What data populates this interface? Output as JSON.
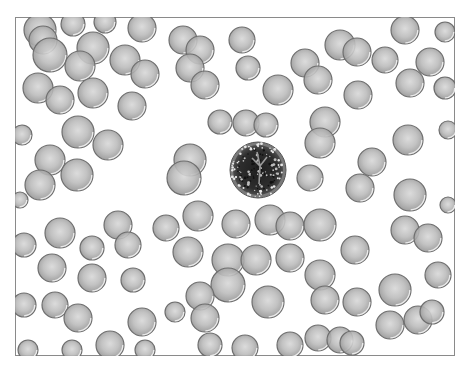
{
  "figure": {
    "width": 470,
    "height": 379,
    "frame": {
      "x": 15,
      "y": 17,
      "w": 440,
      "h": 339
    },
    "colors": {
      "background": "#ffffff",
      "frame_border": "#8a8a8a",
      "rbc_fill": "#b4b4b4",
      "rbc_center": "#d6d6d6",
      "rbc_edge": "#6e6e6e",
      "wbc_fill": "#2a2a2a",
      "wbc_edge": "#555555"
    },
    "leukocyte": {
      "cx": 258,
      "cy": 170,
      "r": 28
    },
    "cells": [
      {
        "cx": 40,
        "cy": 30,
        "r": 16
      },
      {
        "cx": 43,
        "cy": 40,
        "r": 14
      },
      {
        "cx": 50,
        "cy": 55,
        "r": 17
      },
      {
        "cx": 73,
        "cy": 24,
        "r": 12
      },
      {
        "cx": 105,
        "cy": 22,
        "r": 11
      },
      {
        "cx": 142,
        "cy": 28,
        "r": 14
      },
      {
        "cx": 93,
        "cy": 48,
        "r": 16
      },
      {
        "cx": 80,
        "cy": 66,
        "r": 15
      },
      {
        "cx": 125,
        "cy": 60,
        "r": 15
      },
      {
        "cx": 145,
        "cy": 74,
        "r": 14
      },
      {
        "cx": 38,
        "cy": 88,
        "r": 15
      },
      {
        "cx": 60,
        "cy": 100,
        "r": 14
      },
      {
        "cx": 93,
        "cy": 93,
        "r": 15
      },
      {
        "cx": 132,
        "cy": 106,
        "r": 14
      },
      {
        "cx": 183,
        "cy": 40,
        "r": 14
      },
      {
        "cx": 200,
        "cy": 50,
        "r": 14
      },
      {
        "cx": 190,
        "cy": 68,
        "r": 14
      },
      {
        "cx": 205,
        "cy": 85,
        "r": 14
      },
      {
        "cx": 242,
        "cy": 40,
        "r": 13
      },
      {
        "cx": 248,
        "cy": 68,
        "r": 12
      },
      {
        "cx": 278,
        "cy": 90,
        "r": 15
      },
      {
        "cx": 305,
        "cy": 63,
        "r": 14
      },
      {
        "cx": 318,
        "cy": 80,
        "r": 14
      },
      {
        "cx": 340,
        "cy": 45,
        "r": 15
      },
      {
        "cx": 357,
        "cy": 52,
        "r": 14
      },
      {
        "cx": 358,
        "cy": 95,
        "r": 14
      },
      {
        "cx": 405,
        "cy": 30,
        "r": 14
      },
      {
        "cx": 385,
        "cy": 60,
        "r": 13
      },
      {
        "cx": 410,
        "cy": 83,
        "r": 14
      },
      {
        "cx": 430,
        "cy": 62,
        "r": 14
      },
      {
        "cx": 445,
        "cy": 88,
        "r": 11
      },
      {
        "cx": 445,
        "cy": 32,
        "r": 10
      },
      {
        "cx": 220,
        "cy": 122,
        "r": 12
      },
      {
        "cx": 246,
        "cy": 123,
        "r": 13
      },
      {
        "cx": 266,
        "cy": 125,
        "r": 12
      },
      {
        "cx": 325,
        "cy": 122,
        "r": 15
      },
      {
        "cx": 320,
        "cy": 143,
        "r": 15
      },
      {
        "cx": 78,
        "cy": 132,
        "r": 16
      },
      {
        "cx": 108,
        "cy": 145,
        "r": 15
      },
      {
        "cx": 22,
        "cy": 135,
        "r": 10
      },
      {
        "cx": 50,
        "cy": 160,
        "r": 15
      },
      {
        "cx": 77,
        "cy": 175,
        "r": 16
      },
      {
        "cx": 40,
        "cy": 185,
        "r": 15
      },
      {
        "cx": 20,
        "cy": 200,
        "r": 8
      },
      {
        "cx": 190,
        "cy": 160,
        "r": 16
      },
      {
        "cx": 184,
        "cy": 178,
        "r": 17
      },
      {
        "cx": 310,
        "cy": 178,
        "r": 13
      },
      {
        "cx": 372,
        "cy": 162,
        "r": 14
      },
      {
        "cx": 360,
        "cy": 188,
        "r": 14
      },
      {
        "cx": 408,
        "cy": 140,
        "r": 15
      },
      {
        "cx": 410,
        "cy": 195,
        "r": 16
      },
      {
        "cx": 448,
        "cy": 130,
        "r": 9
      },
      {
        "cx": 448,
        "cy": 205,
        "r": 8
      },
      {
        "cx": 60,
        "cy": 233,
        "r": 15
      },
      {
        "cx": 118,
        "cy": 225,
        "r": 14
      },
      {
        "cx": 128,
        "cy": 245,
        "r": 13
      },
      {
        "cx": 166,
        "cy": 228,
        "r": 13
      },
      {
        "cx": 198,
        "cy": 216,
        "r": 15
      },
      {
        "cx": 236,
        "cy": 224,
        "r": 14
      },
      {
        "cx": 270,
        "cy": 220,
        "r": 15
      },
      {
        "cx": 290,
        "cy": 226,
        "r": 14
      },
      {
        "cx": 320,
        "cy": 225,
        "r": 16
      },
      {
        "cx": 24,
        "cy": 245,
        "r": 12
      },
      {
        "cx": 52,
        "cy": 268,
        "r": 14
      },
      {
        "cx": 92,
        "cy": 248,
        "r": 12
      },
      {
        "cx": 92,
        "cy": 278,
        "r": 14
      },
      {
        "cx": 133,
        "cy": 280,
        "r": 12
      },
      {
        "cx": 188,
        "cy": 252,
        "r": 15
      },
      {
        "cx": 228,
        "cy": 260,
        "r": 16
      },
      {
        "cx": 228,
        "cy": 285,
        "r": 17
      },
      {
        "cx": 256,
        "cy": 260,
        "r": 15
      },
      {
        "cx": 290,
        "cy": 258,
        "r": 14
      },
      {
        "cx": 320,
        "cy": 275,
        "r": 15
      },
      {
        "cx": 355,
        "cy": 250,
        "r": 14
      },
      {
        "cx": 405,
        "cy": 230,
        "r": 14
      },
      {
        "cx": 428,
        "cy": 238,
        "r": 14
      },
      {
        "cx": 438,
        "cy": 275,
        "r": 13
      },
      {
        "cx": 24,
        "cy": 305,
        "r": 12
      },
      {
        "cx": 55,
        "cy": 305,
        "r": 13
      },
      {
        "cx": 78,
        "cy": 318,
        "r": 14
      },
      {
        "cx": 142,
        "cy": 322,
        "r": 14
      },
      {
        "cx": 175,
        "cy": 312,
        "r": 10
      },
      {
        "cx": 200,
        "cy": 296,
        "r": 14
      },
      {
        "cx": 205,
        "cy": 318,
        "r": 14
      },
      {
        "cx": 268,
        "cy": 302,
        "r": 16
      },
      {
        "cx": 325,
        "cy": 300,
        "r": 14
      },
      {
        "cx": 357,
        "cy": 302,
        "r": 14
      },
      {
        "cx": 395,
        "cy": 290,
        "r": 16
      },
      {
        "cx": 390,
        "cy": 325,
        "r": 14
      },
      {
        "cx": 418,
        "cy": 320,
        "r": 14
      },
      {
        "cx": 432,
        "cy": 312,
        "r": 12
      },
      {
        "cx": 28,
        "cy": 350,
        "r": 10
      },
      {
        "cx": 72,
        "cy": 350,
        "r": 10
      },
      {
        "cx": 110,
        "cy": 345,
        "r": 14
      },
      {
        "cx": 145,
        "cy": 350,
        "r": 10
      },
      {
        "cx": 210,
        "cy": 345,
        "r": 12
      },
      {
        "cx": 245,
        "cy": 348,
        "r": 13
      },
      {
        "cx": 290,
        "cy": 345,
        "r": 13
      },
      {
        "cx": 318,
        "cy": 338,
        "r": 13
      },
      {
        "cx": 340,
        "cy": 340,
        "r": 13
      },
      {
        "cx": 352,
        "cy": 343,
        "r": 12
      }
    ]
  }
}
